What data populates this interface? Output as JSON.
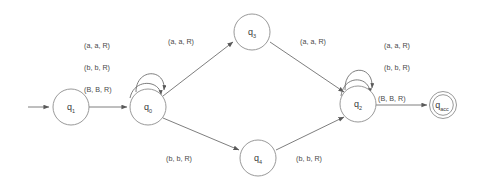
{
  "diagram": {
    "type": "turing-machine-state-diagram",
    "title": "",
    "colors": {
      "background": "#ffffff",
      "node_stroke": "#8d8d8d",
      "edge_stroke": "#6f6f6f",
      "text": "#3a3a3a",
      "label_text": "#4a4a4a"
    },
    "states": [
      {
        "id": "q1",
        "base": "q",
        "sub": "1",
        "cx": 71,
        "cy": 107,
        "r": 18,
        "accepting": false,
        "start": true
      },
      {
        "id": "q0",
        "base": "q",
        "sub": "0",
        "cx": 148,
        "cy": 107,
        "r": 18,
        "accepting": false,
        "start": false
      },
      {
        "id": "q3",
        "base": "q",
        "sub": "3",
        "cx": 252,
        "cy": 32,
        "r": 18,
        "accepting": false,
        "start": false
      },
      {
        "id": "q4",
        "base": "q",
        "sub": "4",
        "cx": 258,
        "cy": 158,
        "r": 18,
        "accepting": false,
        "start": false
      },
      {
        "id": "q2",
        "base": "q",
        "sub": "2",
        "cx": 358,
        "cy": 104,
        "r": 18,
        "accepting": false,
        "start": false
      },
      {
        "id": "qacc",
        "base": "q",
        "sub": "acc",
        "cx": 443,
        "cy": 105,
        "r": 13,
        "r_inner": 10,
        "accepting": true,
        "start": false
      }
    ],
    "start_arrow": {
      "x1": 28,
      "y1": 107,
      "x2": 51,
      "y2": 107
    },
    "transitions": [
      {
        "id": "t-start-q1-q0",
        "from": "q1",
        "to": "q0",
        "label": "",
        "kind": "straight"
      },
      {
        "id": "t-q0-self-a",
        "from": "q0",
        "to": "q0",
        "label": "(a, a, R)",
        "kind": "self-loop"
      },
      {
        "id": "t-q0-self-b",
        "from": "q0",
        "to": "q0",
        "label": "(b, b, R)",
        "kind": "self-loop"
      },
      {
        "id": "t-q0-self-B",
        "from": "q0",
        "to": "q0",
        "label": "(B, B, R)",
        "kind": "self-loop"
      },
      {
        "id": "t-q0-q3",
        "from": "q0",
        "to": "q3",
        "label": "(a, a, R)",
        "kind": "diagonal-up"
      },
      {
        "id": "t-q3-q2",
        "from": "q3",
        "to": "q2",
        "label": "(a, a, R)",
        "kind": "diagonal-down"
      },
      {
        "id": "t-q0-q4",
        "from": "q0",
        "to": "q4",
        "label": "(b, b, R)",
        "kind": "diagonal-down"
      },
      {
        "id": "t-q4-q2",
        "from": "q4",
        "to": "q2",
        "label": "(b, b, R)",
        "kind": "diagonal-up"
      },
      {
        "id": "t-q2-self-a",
        "from": "q2",
        "to": "q2",
        "label": "(a, a, R)",
        "kind": "self-loop"
      },
      {
        "id": "t-q2-self-b",
        "from": "q2",
        "to": "q2",
        "label": "(b, b, R)",
        "kind": "self-loop"
      },
      {
        "id": "t-q2-qacc",
        "from": "q2",
        "to": "qacc",
        "label": "(B, B, R)",
        "kind": "straight"
      }
    ],
    "edge_label_groups": {
      "q0_self_loop": [
        "(a, a, R)",
        "(b, b, R)",
        "(B, B, R)"
      ],
      "q2_self_loop": [
        "(a, a, R)",
        "(b, b, R)"
      ],
      "q0_to_q3": "(a, a, R)",
      "q3_to_q2": "(a, a, R)",
      "q0_to_q4": "(b, b, R)",
      "q4_to_q2": "(b, b, R)",
      "q2_to_qacc": "(B, B, R)"
    }
  }
}
